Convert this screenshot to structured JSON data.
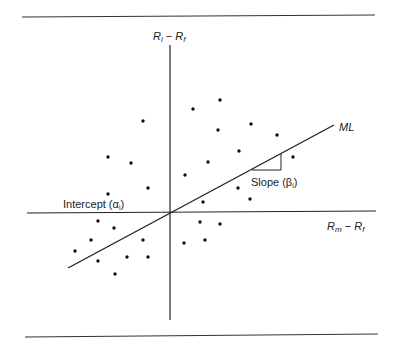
{
  "figure": {
    "type": "characteristic-line-scatter",
    "colors": {
      "ink": "#222222",
      "background": "#ffffff"
    },
    "labels": {
      "y_axis": {
        "main": "R",
        "sub1": "i",
        "dash": " − ",
        "main2": "R",
        "sub2": "f"
      },
      "x_axis": {
        "main": "R",
        "sub1": "m",
        "dash": " − ",
        "main2": "R",
        "sub2": "f"
      },
      "line": "ML",
      "intercept": {
        "text": "Intercept (",
        "symbol": "α",
        "sub": "i",
        "close": ")"
      },
      "slope": {
        "text": "Slope (",
        "symbol": "β",
        "sub": "i",
        "close": ")"
      }
    }
  },
  "chart_data": {
    "type": "scatter",
    "title": "",
    "xlabel": "Rm − Rf",
    "ylabel": "Ri − Rf",
    "grid": false,
    "origin_px": [
      170,
      212
    ],
    "points_px": [
      [
        143,
        121
      ],
      [
        108,
        157
      ],
      [
        131,
        163
      ],
      [
        108,
        194
      ],
      [
        148,
        188
      ],
      [
        193,
        109
      ],
      [
        220,
        100
      ],
      [
        218,
        130
      ],
      [
        251,
        124
      ],
      [
        277,
        135
      ],
      [
        239,
        151
      ],
      [
        208,
        162
      ],
      [
        293,
        157
      ],
      [
        185,
        175
      ],
      [
        238,
        188
      ],
      [
        250,
        199
      ],
      [
        203,
        202
      ],
      [
        200,
        222
      ],
      [
        220,
        224
      ],
      [
        184,
        243
      ],
      [
        205,
        240
      ],
      [
        98,
        221
      ],
      [
        114,
        228
      ],
      [
        91,
        240
      ],
      [
        143,
        240
      ],
      [
        75,
        251
      ],
      [
        98,
        261
      ],
      [
        127,
        257
      ],
      [
        148,
        257
      ],
      [
        115,
        274
      ]
    ],
    "regression_line_px": {
      "start": [
        68,
        268
      ],
      "end": [
        334,
        125
      ]
    },
    "annotations": [
      "ML",
      "Intercept (αi)",
      "Slope (βi)"
    ]
  }
}
